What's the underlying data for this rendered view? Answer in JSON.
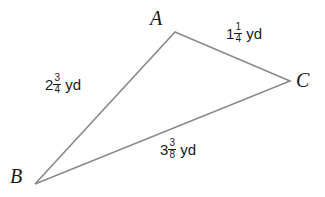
{
  "figure": {
    "type": "triangle-diagram",
    "background_color": "#ffffff",
    "stroke_color": "#8a8a8a",
    "text_color": "#1a1a1a"
  },
  "vertices": [
    {
      "name": "A",
      "label": "A",
      "x": 175,
      "y": 32,
      "label_x": 150,
      "label_y": 8
    },
    {
      "name": "B",
      "label": "B",
      "x": 35,
      "y": 184,
      "label_x": 10,
      "label_y": 166
    },
    {
      "name": "C",
      "label": "C",
      "x": 290,
      "y": 81,
      "label_x": 296,
      "label_y": 70
    }
  ],
  "sides": [
    {
      "name": "side-AC",
      "from": "A",
      "to": "C",
      "whole": "1",
      "numerator": "1",
      "denominator": "4",
      "unit": "yd",
      "text": "1 1/4 yd",
      "label_x": 226,
      "label_y": 22
    },
    {
      "name": "side-AB",
      "from": "A",
      "to": "B",
      "whole": "2",
      "numerator": "3",
      "denominator": "4",
      "unit": "yd",
      "text": "2 3/4 yd",
      "label_x": 45,
      "label_y": 73
    },
    {
      "name": "side-BC",
      "from": "B",
      "to": "C",
      "whole": "3",
      "numerator": "3",
      "denominator": "8",
      "unit": "yd",
      "text": "3 3/8 yd",
      "label_x": 160,
      "label_y": 138
    }
  ]
}
